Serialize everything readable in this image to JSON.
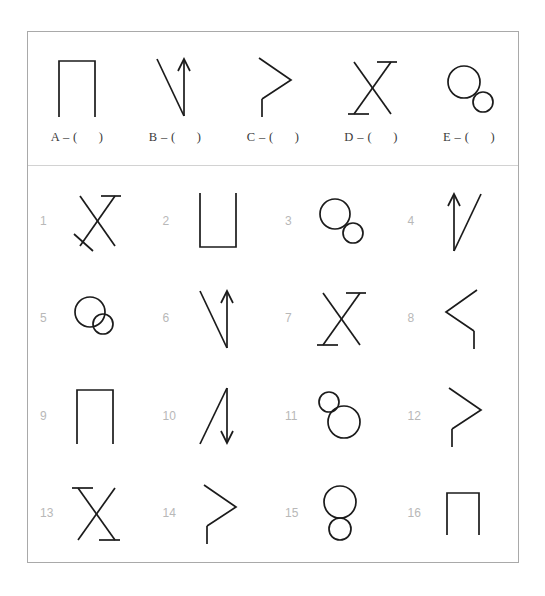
{
  "worksheet": {
    "title": "Shape matching worksheet",
    "prompt_row": {
      "items": [
        {
          "letter": "A",
          "answer_label": "A – (      )",
          "shape": "square-bracket-cap"
        },
        {
          "letter": "B",
          "answer_label": "B – (      )",
          "shape": "v-with-up-arrow-right"
        },
        {
          "letter": "C",
          "answer_label": "C – (      )",
          "shape": "greater-than-with-stem"
        },
        {
          "letter": "D",
          "answer_label": "D – (      )",
          "shape": "x-with-bars-tr-bl"
        },
        {
          "letter": "E",
          "answer_label": "E – (      )",
          "shape": "big-circle-small-circle-lower-right"
        }
      ]
    },
    "options": [
      {
        "number": "1",
        "shape": "x-with-bar-tr-and-tick-bl"
      },
      {
        "number": "2",
        "shape": "u-cup"
      },
      {
        "number": "3",
        "shape": "big-circle-small-circle-lower-right"
      },
      {
        "number": "4",
        "shape": "up-arrow-left-with-diagonal-right"
      },
      {
        "number": "5",
        "shape": "big-circle-small-circle-overlapping"
      },
      {
        "number": "6",
        "shape": "v-with-up-arrow-right"
      },
      {
        "number": "7",
        "shape": "x-with-bars-tr-bl"
      },
      {
        "number": "8",
        "shape": "less-than-with-stem"
      },
      {
        "number": "9",
        "shape": "square-bracket-cap"
      },
      {
        "number": "10",
        "shape": "diagonal-with-down-arrow-right"
      },
      {
        "number": "11",
        "shape": "small-circle-upper-left-big-circle-lower-right"
      },
      {
        "number": "12",
        "shape": "greater-than-with-stem"
      },
      {
        "number": "13",
        "shape": "x-with-bars-tl-br"
      },
      {
        "number": "14",
        "shape": "greater-than-plain"
      },
      {
        "number": "15",
        "shape": "big-circle-above-small-circle"
      },
      {
        "number": "16",
        "shape": "square-bracket-cap-small"
      }
    ],
    "colors": {
      "frame": "#a9a9a9",
      "divider": "#d2d2d2",
      "stroke": "#1b1b1b",
      "number": "#b8b8b8",
      "answer_text": "#3a3a3a",
      "background": "#ffffff"
    }
  }
}
